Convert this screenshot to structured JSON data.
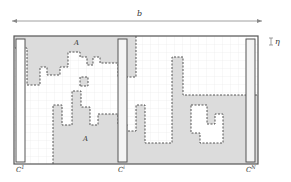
{
  "diagram": {
    "width_label": "b",
    "step_label": "η",
    "region_label_top": "A",
    "region_label_bottom": "A",
    "columns": [
      {
        "label": "C",
        "sup": "1"
      },
      {
        "label": "C",
        "sup": "i"
      },
      {
        "label": "C",
        "sup": "N"
      }
    ],
    "colors": {
      "shade": "#dcdcdc",
      "grid": "#e6e6e6",
      "border": "#555555",
      "dashed": "#444444",
      "arrow": "#888888"
    }
  }
}
